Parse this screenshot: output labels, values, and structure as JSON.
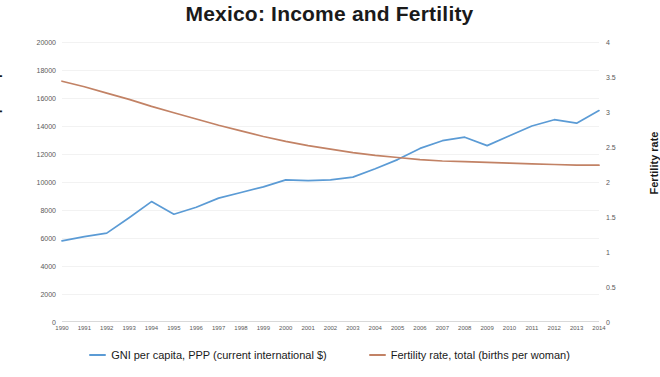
{
  "chart_data": {
    "type": "line",
    "title": "Mexico: Income and Fertility",
    "xlabel": "",
    "ylabel": "GNI per capita",
    "ylabel_secondary": "Fertility rate",
    "grid": true,
    "legend_position": "bottom",
    "x": [
      1990,
      1991,
      1992,
      1993,
      1994,
      1995,
      1996,
      1997,
      1998,
      1999,
      2000,
      2001,
      2002,
      2003,
      2004,
      2005,
      2006,
      2007,
      2008,
      2009,
      2010,
      2011,
      2012,
      2013,
      2014
    ],
    "categories": [
      "1990",
      "1991",
      "1992",
      "1993",
      "1994",
      "1995",
      "1996",
      "1997",
      "1998",
      "1999",
      "2000",
      "2001",
      "2002",
      "2003",
      "2004",
      "2005",
      "2006",
      "2007",
      "2008",
      "2009",
      "2010",
      "2011",
      "2012",
      "2013",
      "2014"
    ],
    "ylim": [
      0,
      20000
    ],
    "ylim_secondary": [
      0,
      4
    ],
    "yticks": [
      "0",
      "2000",
      "4000",
      "6000",
      "8000",
      "10000",
      "12000",
      "14000",
      "16000",
      "18000",
      "20000"
    ],
    "ytick_values": [
      0,
      2000,
      4000,
      6000,
      8000,
      10000,
      12000,
      14000,
      16000,
      18000,
      20000
    ],
    "yticks_secondary": [
      "0",
      "0.5",
      "1",
      "1.5",
      "2",
      "2.5",
      "3",
      "3.5",
      "4"
    ],
    "ytick_values_secondary": [
      0,
      0.5,
      1,
      1.5,
      2,
      2.5,
      3,
      3.5,
      4
    ],
    "series": [
      {
        "name": "GNI per capita, PPP (current international $)",
        "axis": "left",
        "color": "#5B9BD5",
        "values": [
          5800,
          6100,
          6350,
          7450,
          8600,
          7700,
          8200,
          8850,
          9250,
          9650,
          10150,
          10100,
          10150,
          10350,
          10950,
          11600,
          12400,
          12950,
          13200,
          12600,
          13300,
          14000,
          14450,
          14200,
          15100
        ]
      },
      {
        "name": "Fertility rate, total (births per woman)",
        "axis": "right",
        "color": "#C28265",
        "values": [
          3.44,
          3.36,
          3.27,
          3.18,
          3.08,
          2.99,
          2.9,
          2.81,
          2.73,
          2.65,
          2.58,
          2.52,
          2.47,
          2.42,
          2.38,
          2.35,
          2.32,
          2.3,
          2.29,
          2.28,
          2.27,
          2.26,
          2.25,
          2.24,
          2.24
        ]
      }
    ]
  },
  "axes": {
    "left_title": "GNI per capita",
    "right_title": "Fertility rate"
  },
  "legend": {
    "items": [
      {
        "label": "GNI per capita, PPP (current international $)",
        "color": "#5B9BD5"
      },
      {
        "label": "Fertility rate, total (births per woman)",
        "color": "#C28265"
      }
    ]
  }
}
